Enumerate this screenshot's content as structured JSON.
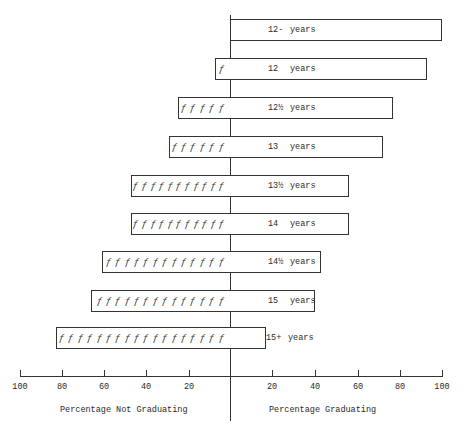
{
  "chart_data": {
    "type": "bar",
    "orientation": "horizontal-diverging",
    "title": "",
    "categories": [
      "12- years",
      "12 years",
      "12½ years",
      "13 years",
      "13½ years",
      "14 years",
      "14½ years",
      "15 years",
      "15+ years"
    ],
    "series": [
      {
        "name": "Percentage Not Graduating",
        "values": [
          0,
          7,
          25,
          29,
          47,
          47,
          61,
          66,
          83
        ],
        "icon_counts": [
          0,
          1,
          5,
          6,
          11,
          11,
          13,
          14,
          18
        ]
      },
      {
        "name": "Percentage Graduating",
        "values": [
          100,
          93,
          77,
          72,
          56,
          56,
          43,
          40,
          17
        ]
      }
    ],
    "xlabel_left": "Percentage Not Graduating",
    "xlabel_right": "Percentage Graduating",
    "left_ticks": [
      "100",
      "80",
      "60",
      "40",
      "20"
    ],
    "right_ticks": [
      "20",
      "40",
      "60",
      "80",
      "100"
    ],
    "xlim_left": [
      100,
      0
    ],
    "xlim_right": [
      0,
      100
    ],
    "grid": false,
    "legend": "none",
    "icon_glyph": "running-figure"
  },
  "bars": [
    {
      "label": "12-",
      "unit": "years"
    },
    {
      "label": "12",
      "unit": "years"
    },
    {
      "label": "12½",
      "unit": "years"
    },
    {
      "label": "13",
      "unit": "years"
    },
    {
      "label": "13½",
      "unit": "years"
    },
    {
      "label": "14",
      "unit": "years"
    },
    {
      "label": "14½",
      "unit": "years"
    },
    {
      "label": "15",
      "unit": "years"
    },
    {
      "label": "15+",
      "unit": "years"
    }
  ],
  "axis": {
    "left_ticks": [
      "100",
      "80",
      "60",
      "40",
      "20"
    ],
    "right_ticks": [
      "20",
      "40",
      "60",
      "80",
      "100"
    ],
    "left_label": "Percentage Not Graduating",
    "right_label": "Percentage Graduating"
  },
  "colors": {
    "ink": "#333333",
    "background": "#ffffff"
  }
}
